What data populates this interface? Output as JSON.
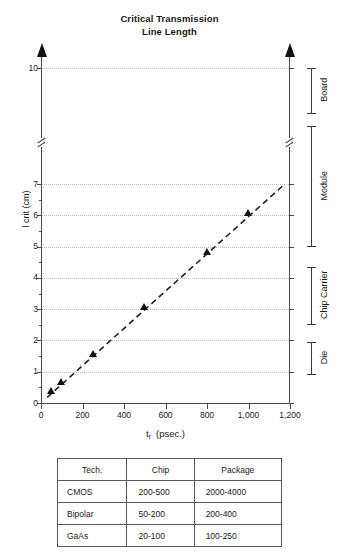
{
  "chart_data": {
    "type": "scatter",
    "title": "Critical Transmission Line Length",
    "title_lines": [
      "Critical Transmission",
      "Line Length"
    ],
    "xlabel_main": "t",
    "xlabel_sub": "r",
    "xlabel_unit": "(psec.)",
    "ylabel": "l crit (cm)",
    "xlim": [
      0,
      1200
    ],
    "ylim": [
      0,
      10
    ],
    "grid": true,
    "legend": "none",
    "axis_break": {
      "between": [
        7,
        10
      ],
      "note": "y-axis broken between 7 and 10"
    },
    "xticks": [
      0,
      200,
      400,
      600,
      800,
      1000,
      1200
    ],
    "xtick_labels": [
      "0",
      "200",
      "400",
      "600",
      "800",
      "1,000",
      "1,200"
    ],
    "yticks": [
      0,
      1,
      2,
      3,
      4,
      5,
      6,
      7,
      10
    ],
    "ytick_labels": [
      "0",
      "1",
      "2",
      "3",
      "4",
      "5",
      "6",
      "7",
      "10"
    ],
    "x": [
      50,
      100,
      250,
      500,
      800,
      1000
    ],
    "y": [
      0.3,
      0.6,
      1.5,
      3.0,
      4.75,
      6.0
    ],
    "series": [
      {
        "name": "Critical length",
        "marker": "triangle",
        "points": [
          {
            "x": 50,
            "y": 0.3
          },
          {
            "x": 100,
            "y": 0.6
          },
          {
            "x": 250,
            "y": 1.5
          },
          {
            "x": 500,
            "y": 3.0
          },
          {
            "x": 800,
            "y": 4.75
          },
          {
            "x": 1000,
            "y": 6.0
          }
        ]
      }
    ],
    "trendline": {
      "style": "dashed",
      "x0": 30,
      "y0": 0.18,
      "x1": 1175,
      "y1": 7.0
    },
    "annotations": [
      {
        "label": "Board",
        "y_from": 8.25,
        "y_to": 10.0
      },
      {
        "label": "Module",
        "y_from": 5.05,
        "y_to": 7.7
      },
      {
        "label": "Chip Carrier",
        "y_from": 2.55,
        "y_to": 4.35
      },
      {
        "label": "Die",
        "y_from": 0.95,
        "y_to": 1.95
      }
    ]
  },
  "table": {
    "headers": [
      "Tech.",
      "Chip",
      "Package"
    ],
    "rows": [
      [
        "CMOS",
        "200-500",
        "2000-4000"
      ],
      [
        "Bipolar",
        "50-200",
        "200-400"
      ],
      [
        "GaAs",
        "20-100",
        "100-250"
      ]
    ]
  },
  "colors": {
    "axis": "#4a4a4a",
    "marker": "#111111",
    "grid": "#b9b9b9",
    "text": "#1a1a1a"
  }
}
